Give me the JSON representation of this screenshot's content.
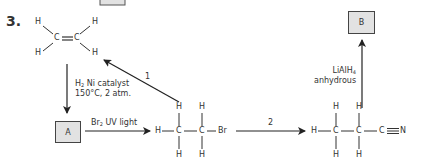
{
  "question_number": "3.",
  "boxes": {
    "A": "A",
    "B": "B"
  },
  "ethene": {
    "atoms": [
      "H",
      "H",
      "C",
      "C",
      "H",
      "H"
    ],
    "name": "ethene-structure"
  },
  "bromoethane": {
    "top_h": [
      "H",
      "H"
    ],
    "row": [
      "H",
      "C",
      "C",
      "Br"
    ],
    "bottom_h": [
      "H",
      "H"
    ]
  },
  "propanenitrile": {
    "top_h": [
      "H",
      "H"
    ],
    "row": [
      "H",
      "C",
      "C",
      "C",
      "N"
    ],
    "bottom_h": [
      "H",
      "H"
    ]
  },
  "conditions": {
    "hydrogenation_line1_main": "H",
    "hydrogenation_line1_sub": "2",
    "hydrogenation_line1_rest": " Ni catalyst",
    "hydrogenation_line2": "150°C, 2 atm.",
    "bromination_main": "Br",
    "bromination_sub": "2",
    "bromination_rest": " UV light",
    "reduction_line1_main": "LiAlH",
    "reduction_line1_sub": "4",
    "reduction_line2": "anhydrous"
  },
  "arrow_labels": {
    "step1": "1",
    "step2": "2"
  },
  "colors": {
    "box_fill": "#e2e2e2",
    "line": "#333333"
  }
}
